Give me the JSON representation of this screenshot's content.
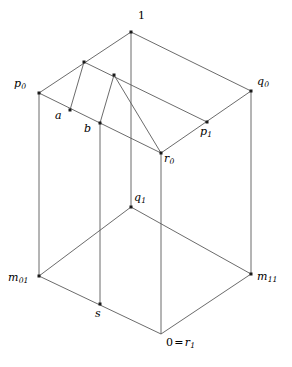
{
  "figure": {
    "kind": "3d-lattice-cube-diagram",
    "line_color": "#5a5a5a",
    "dot_color": "#1a1a1a",
    "background": "#ffffff",
    "width": 292,
    "height": 367
  },
  "vertices": [
    {
      "id": "one",
      "base": "1",
      "sub": "",
      "x": 131,
      "y": 32,
      "label_x": 138,
      "label_y": 10,
      "upright": true,
      "dot": true
    },
    {
      "id": "p0",
      "base": "p",
      "sub": "0",
      "x": 39,
      "y": 93,
      "label_x": 14,
      "label_y": 78,
      "upright": false,
      "dot": true
    },
    {
      "id": "q0",
      "base": "q",
      "sub": "0",
      "x": 251,
      "y": 91,
      "label_x": 257,
      "label_y": 76,
      "upright": false,
      "dot": true
    },
    {
      "id": "a",
      "base": "a",
      "sub": "",
      "x": 70,
      "y": 110,
      "label_x": 55,
      "label_y": 110,
      "upright": false,
      "dot": true
    },
    {
      "id": "b",
      "base": "b",
      "sub": "",
      "x": 100,
      "y": 123,
      "label_x": 84,
      "label_y": 123,
      "upright": false,
      "dot": true
    },
    {
      "id": "p1",
      "base": "p",
      "sub": "1",
      "x": 207,
      "y": 122,
      "label_x": 200,
      "label_y": 126,
      "upright": false,
      "dot": true
    },
    {
      "id": "r0",
      "base": "r",
      "sub": "0",
      "x": 161,
      "y": 153,
      "label_x": 164,
      "label_y": 153,
      "upright": false,
      "dot": true
    },
    {
      "id": "q1",
      "base": "q",
      "sub": "1",
      "x": 131,
      "y": 207,
      "label_x": 134,
      "label_y": 192,
      "upright": false,
      "dot": true
    },
    {
      "id": "m01",
      "base": "m",
      "sub": "01",
      "x": 39,
      "y": 276,
      "label_x": 8,
      "label_y": 272,
      "upright": false,
      "dot": true
    },
    {
      "id": "m11",
      "base": "m",
      "sub": "11",
      "x": 251,
      "y": 274,
      "label_x": 257,
      "label_y": 271,
      "upright": false,
      "dot": true
    },
    {
      "id": "s",
      "base": "s",
      "sub": "",
      "x": 100,
      "y": 304,
      "label_x": 95,
      "label_y": 308,
      "upright": false,
      "dot": true
    },
    {
      "id": "anon1",
      "base": "",
      "sub": "",
      "x": 84,
      "y": 62,
      "label_x": 0,
      "label_y": 0,
      "upright": false,
      "dot": true
    },
    {
      "id": "anon2",
      "base": "",
      "sub": "",
      "x": 114,
      "y": 75,
      "label_x": 0,
      "label_y": 0,
      "upright": false,
      "dot": true
    }
  ],
  "special_labels": [
    {
      "id": "zero-eq-r1",
      "prefix": "0",
      "op": "=",
      "base": "r",
      "sub": "1",
      "x": 161,
      "y": 334,
      "label_x": 166,
      "label_y": 337
    }
  ],
  "edges": [
    {
      "id": "p0-1",
      "x1": 39,
      "y1": 93,
      "x2": 131,
      "y2": 32
    },
    {
      "id": "1-q0",
      "x1": 131,
      "y1": 32,
      "x2": 251,
      "y2": 91
    },
    {
      "id": "p0-r0",
      "x1": 39,
      "y1": 93,
      "x2": 161,
      "y2": 153
    },
    {
      "id": "r0-q0",
      "x1": 161,
      "y1": 153,
      "x2": 251,
      "y2": 91
    },
    {
      "id": "anon1-p1",
      "x1": 84,
      "y1": 62,
      "x2": 207,
      "y2": 122
    },
    {
      "id": "anon2-r0a",
      "x1": 114,
      "y1": 75,
      "x2": 161,
      "y2": 153
    },
    {
      "id": "a-anon1",
      "x1": 70,
      "y1": 110,
      "x2": 84,
      "y2": 62
    },
    {
      "id": "b-anon2",
      "x1": 100,
      "y1": 123,
      "x2": 114,
      "y2": 75
    },
    {
      "id": "1-q1",
      "x1": 131,
      "y1": 32,
      "x2": 131,
      "y2": 207
    },
    {
      "id": "p0-m01",
      "x1": 39,
      "y1": 93,
      "x2": 39,
      "y2": 276
    },
    {
      "id": "q0-m11",
      "x1": 251,
      "y1": 91,
      "x2": 251,
      "y2": 274
    },
    {
      "id": "b-s",
      "x1": 100,
      "y1": 123,
      "x2": 100,
      "y2": 304
    },
    {
      "id": "r0-r1",
      "x1": 161,
      "y1": 153,
      "x2": 161,
      "y2": 334
    },
    {
      "id": "m01-q1",
      "x1": 39,
      "y1": 276,
      "x2": 131,
      "y2": 207
    },
    {
      "id": "q1-m11",
      "x1": 131,
      "y1": 207,
      "x2": 251,
      "y2": 274
    },
    {
      "id": "m01-r1",
      "x1": 39,
      "y1": 276,
      "x2": 161,
      "y2": 334
    },
    {
      "id": "r1-m11",
      "x1": 161,
      "y1": 334,
      "x2": 251,
      "y2": 274
    }
  ]
}
